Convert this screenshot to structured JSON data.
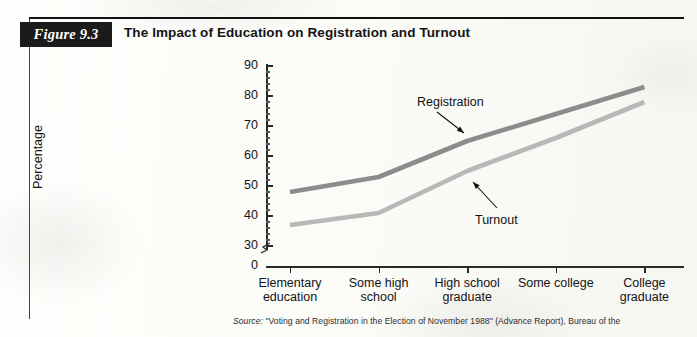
{
  "figure": {
    "tab_label": "Figure 9.3",
    "title": "The Impact of Education on Registration and Turnout"
  },
  "source": {
    "prefix": "Source:",
    "text": " \"Voting and Registration in the Election of November 1988\" (Advance Report), Bureau of the"
  },
  "chart_data": {
    "type": "line",
    "title": "The Impact of Education on Registration and Turnout",
    "xlabel": "",
    "ylabel": "Percentage",
    "categories": [
      "Elementary education",
      "Some high school",
      "High school graduate",
      "Some college",
      "College graduate"
    ],
    "category_lines": [
      [
        "Elementary",
        "education"
      ],
      [
        "Some high",
        "school"
      ],
      [
        "High school",
        "graduate"
      ],
      [
        "Some college",
        ""
      ],
      [
        "College",
        "graduate"
      ]
    ],
    "series": [
      {
        "name": "Registration",
        "color": "#8c8c8c",
        "values": [
          48,
          53,
          65,
          74,
          83
        ]
      },
      {
        "name": "Turnout",
        "color": "#b8b8b8",
        "values": [
          37,
          41,
          55,
          66,
          78
        ]
      }
    ],
    "yticks": [
      90,
      80,
      70,
      60,
      50,
      40,
      30
    ],
    "ytick_zero": 0,
    "ylim": [
      30,
      90
    ],
    "axis_break": true,
    "grid": false,
    "legend": "annotations",
    "annotations": [
      {
        "text": "Registration",
        "points_to_series": "Registration"
      },
      {
        "text": "Turnout",
        "points_to_series": "Turnout"
      }
    ]
  }
}
